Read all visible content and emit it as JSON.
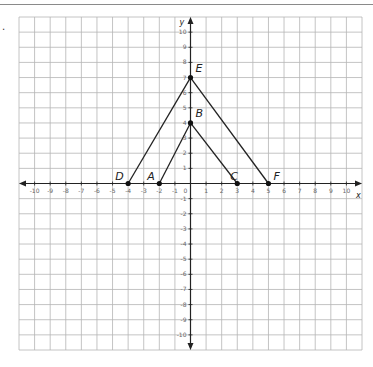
{
  "problem": {
    "marker": "."
  },
  "axes": {
    "x_label": "x",
    "y_label": "y",
    "x_min": -10,
    "x_max": 10,
    "y_min": -10,
    "y_max": 10,
    "x_ticks": [
      "-10",
      "-9",
      "-8",
      "-7",
      "-6",
      "-5",
      "-4",
      "-3",
      "-2",
      "-1",
      "0",
      "1",
      "2",
      "3",
      "4",
      "5",
      "6",
      "7",
      "8",
      "9",
      "10"
    ],
    "y_ticks": [
      "10",
      "9",
      "8",
      "7",
      "6",
      "5",
      "4",
      "3",
      "2",
      "1",
      "-1",
      "-2",
      "-3",
      "-4",
      "-5",
      "-6",
      "-7",
      "-8",
      "-9",
      "-10"
    ]
  },
  "points": [
    {
      "name": "A",
      "x": -2,
      "y": 0
    },
    {
      "name": "B",
      "x": 0,
      "y": 4
    },
    {
      "name": "C",
      "x": 3,
      "y": 0
    },
    {
      "name": "D",
      "x": -4,
      "y": 0
    },
    {
      "name": "E",
      "x": 0,
      "y": 7
    },
    {
      "name": "F",
      "x": 5,
      "y": 0
    }
  ],
  "segments": [
    [
      "A",
      "B"
    ],
    [
      "B",
      "C"
    ],
    [
      "D",
      "E"
    ],
    [
      "E",
      "F"
    ]
  ],
  "colors": {
    "grid": "#b5b5b5",
    "axis": "#222222",
    "line": "#222222",
    "point": "#111111"
  }
}
